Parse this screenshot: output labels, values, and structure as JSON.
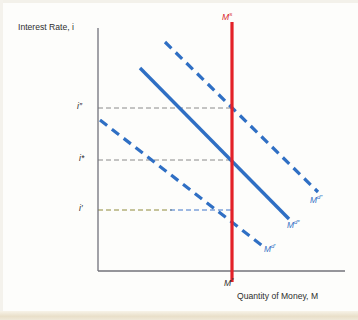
{
  "figure": {
    "axes": {
      "y_axis_title": "Interest Rate, i",
      "x_axis_title": "Quantity of Money, M",
      "y_ticks": [
        {
          "id": "i-double-prime",
          "label": "i″",
          "base": "i",
          "sup": "″",
          "y": 108
        },
        {
          "id": "i-star",
          "label": "i*",
          "base": "i",
          "sup": "*",
          "y": 160
        },
        {
          "id": "i-prime",
          "label": "i′",
          "base": "i",
          "sup": "′",
          "y": 210
        }
      ],
      "x_ticks": [
        {
          "id": "m-star",
          "label": "M*",
          "base": "M",
          "sup": "*",
          "x": 232
        }
      ]
    },
    "supply_curve": {
      "id": "money-supply",
      "label_base": "M",
      "label_sup": "s",
      "label": "Mˢ",
      "color": "#e32128",
      "style": "solid",
      "x": 232
    },
    "demand_curves": [
      {
        "id": "money-demand-prime",
        "label_base": "M",
        "label_sup": "d′",
        "label": "Mᵈ′",
        "color": "#2f6fc4",
        "style": "dashed",
        "x1": 100,
        "y1": 120,
        "x2": 264,
        "y2": 247
      },
      {
        "id": "money-demand-star",
        "label_base": "M",
        "label_sup": "d*",
        "label": "Mᵈ*",
        "color": "#2f6fc4",
        "style": "solid",
        "x1": 140,
        "y1": 68,
        "x2": 289,
        "y2": 219
      },
      {
        "id": "money-demand-double-prime",
        "label_base": "M",
        "label_sup": "d″",
        "label": "Mᵈ″",
        "color": "#2f6fc4",
        "style": "dashed",
        "x1": 165,
        "y1": 42,
        "x2": 318,
        "y2": 192
      }
    ],
    "guide_lines": [
      {
        "id": "guide-i-double-prime",
        "y": 108,
        "x_from": 98,
        "x_to": 232,
        "color": "#8a8a8a",
        "style": "dashed"
      },
      {
        "id": "guide-i-star",
        "y": 160,
        "x_from": 98,
        "x_to": 232,
        "color": "#8a8a8a",
        "style": "dashed"
      },
      {
        "id": "guide-i-prime-left",
        "y": 210,
        "x_from": 98,
        "x_to": 170,
        "color": "#8f8a3a",
        "style": "dashed"
      },
      {
        "id": "guide-i-prime-right",
        "y": 210,
        "x_from": 170,
        "x_to": 232,
        "color": "#3f74c9",
        "style": "dashed"
      }
    ],
    "colors": {
      "supply": "#e32128",
      "demand": "#2f6fc4",
      "axis": "#6f6f74",
      "guide": "#8a8a8a",
      "text": "#2b2b2b",
      "background": "#fdfdfb"
    }
  }
}
